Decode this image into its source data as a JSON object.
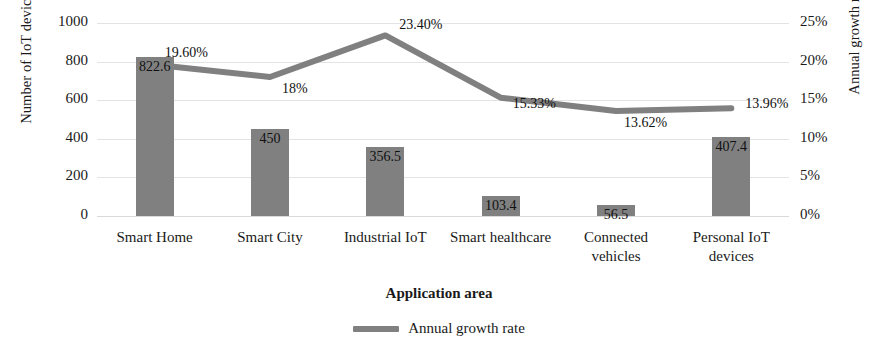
{
  "chart_data": {
    "type": "bar",
    "title": "",
    "categories": [
      "Smart Home",
      "Smart City",
      "Industrial IoT",
      "Smart healthcare",
      "Connected vehicles",
      "Personal IoT devices"
    ],
    "series": [
      {
        "name": "Number of IoT devices (millions)",
        "type": "bar",
        "axis": "left",
        "values": [
          822.6,
          450,
          356.5,
          103.4,
          56.5,
          407.4
        ],
        "value_labels": [
          "822.6",
          "450",
          "356.5",
          "103.4",
          "56.5",
          "407.4"
        ],
        "color": "#808080"
      },
      {
        "name": "Annual growth rate",
        "type": "line",
        "axis": "right",
        "values": [
          19.6,
          18,
          23.4,
          15.33,
          13.62,
          13.96
        ],
        "value_labels": [
          "19.60%",
          "18%",
          "23.40%",
          "15.33%",
          "13.62%",
          "13.96%"
        ],
        "color": "#808080"
      }
    ],
    "xlabel": "Application area",
    "ylabel": "Number of IoT devices (millions)",
    "y2label": "Annual growth rate (%)",
    "ylim": [
      0,
      1000
    ],
    "y2lim": [
      0,
      25
    ],
    "yticks": [
      "0",
      "200",
      "400",
      "600",
      "800",
      "1000"
    ],
    "y2ticks": [
      "0%",
      "5%",
      "10%",
      "15%",
      "20%",
      "25%"
    ],
    "grid": true,
    "legend": [
      "Annual growth rate"
    ],
    "legend_position": "bottom-center"
  },
  "axes": {
    "left_title": "Number of IoT devices (millions)",
    "right_title": "Annual growth rate (%)",
    "x_title": "Application area"
  },
  "legend": {
    "items": [
      {
        "label": "Annual growth rate",
        "color": "#808080"
      }
    ]
  }
}
